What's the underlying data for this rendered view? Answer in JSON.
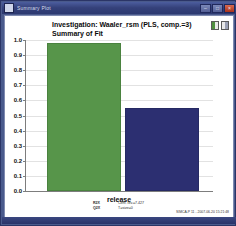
{
  "window": {
    "title": "Summary Plot",
    "app_icon": "plot-window-icon",
    "controls": {
      "minimize": "–",
      "maximize": "□",
      "close": "×"
    }
  },
  "chart_header": {
    "title": "Investigation: Waaler_rsm (PLS, comp.=3)",
    "subtitle": "Summary of Fit",
    "legend_icons": [
      "r2-legend-icon",
      "q2-legend-icon"
    ]
  },
  "footer": {
    "keys": [
      "R2X",
      "Q2X"
    ],
    "values": [
      "Cent. lev.=7.427",
      "T=size=0"
    ],
    "timestamp": "SIMCA-P 11 - 2007-06-20 15:21:48"
  },
  "chart_data": {
    "type": "bar",
    "title": "Investigation: Waaler_rsm (PLS, comp.=3)",
    "subtitle": "Summary of Fit",
    "categories": [
      "R2",
      "Q2"
    ],
    "values": [
      0.98,
      0.55
    ],
    "colors": [
      "#57954a",
      "#2c2f71"
    ],
    "xlabel": "release",
    "ylabel": "",
    "ylim": [
      0.0,
      1.0
    ],
    "ytick_labels": [
      "1.0",
      "0.9",
      "0.8",
      "0.7",
      "0.6",
      "0.5",
      "0.4",
      "0.3",
      "0.2",
      "0.1",
      "0.0"
    ],
    "ytick_values": [
      1.0,
      0.9,
      0.8,
      0.7,
      0.6,
      0.5,
      0.4,
      0.3,
      0.2,
      0.1,
      0.0
    ],
    "grid": true,
    "legend_position": "top-right"
  }
}
